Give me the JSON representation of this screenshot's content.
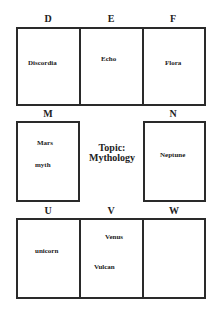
{
  "topic": {
    "line1": "Topic:",
    "line2": "Mythology"
  },
  "cells": {
    "D": {
      "letter": "D",
      "words": [
        "Discordia"
      ]
    },
    "E": {
      "letter": "E",
      "words": [
        "Echo"
      ]
    },
    "F": {
      "letter": "F",
      "words": [
        "Flora"
      ]
    },
    "M": {
      "letter": "M",
      "words": [
        "Mars",
        "myth"
      ]
    },
    "N": {
      "letter": "N",
      "words": [
        "Neptune"
      ]
    },
    "U": {
      "letter": "U",
      "words": [
        "unicorn"
      ]
    },
    "V": {
      "letter": "V",
      "words": [
        "Venus",
        "Vulcan"
      ]
    },
    "W": {
      "letter": "W",
      "words": []
    }
  }
}
